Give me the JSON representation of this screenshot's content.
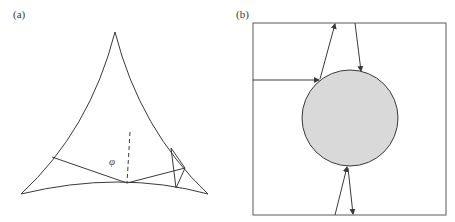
{
  "figure": {
    "panel_a": {
      "label": "(a)",
      "description": "Curved triangular (deltoid-like) billiard with a trajectory bouncing off the boundary",
      "angle_symbol": "φ"
    },
    "panel_b": {
      "label": "(b)",
      "description": "Square billiard with a central grey circular scatterer and trajectory arrows reflecting off walls and circle",
      "circle_fill": "#d9d9d9"
    },
    "colors": {
      "line": "#3a3a3a",
      "background": "#ffffff",
      "circle_fill": "#d9d9d9"
    }
  }
}
